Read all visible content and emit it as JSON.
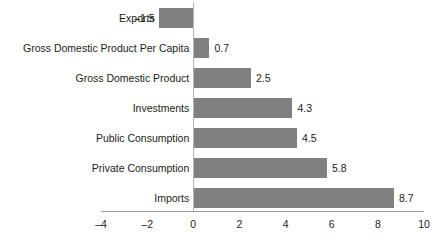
{
  "chart_data": {
    "type": "bar",
    "orientation": "horizontal",
    "title": "",
    "subtitle": "",
    "xlabel": "",
    "ylabel": "",
    "categories": [
      "Exports",
      "Gross Domestic Product Per Capita",
      "Gross Domestic Product",
      "Investments",
      "Public Consumption",
      "Private Consumption",
      "Imports"
    ],
    "values": [
      -1.5,
      0.7,
      2.5,
      4.3,
      4.5,
      5.8,
      8.7
    ],
    "value_labels": [
      "–1.5",
      "0.7",
      "2.5",
      "4.3",
      "4.5",
      "5.8",
      "8.7"
    ],
    "xlim": [
      -4,
      10
    ],
    "xticks": [
      -4,
      -2,
      0,
      2,
      4,
      6,
      8,
      10
    ],
    "xtick_labels": [
      "–4",
      "–2",
      "0",
      "2",
      "4",
      "6",
      "8",
      "10"
    ],
    "grid": false,
    "legend": false,
    "legend_position": "none",
    "bar_color": "#808080",
    "axis_color": "#9a9a9a",
    "text_color": "#1c1c1c"
  }
}
